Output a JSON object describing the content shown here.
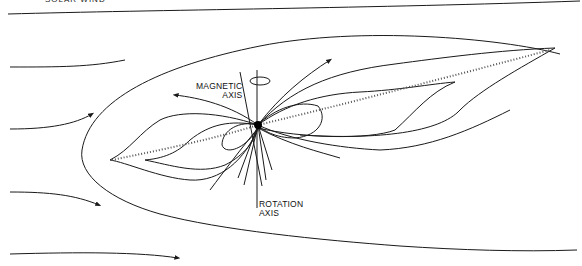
{
  "diagram": {
    "title_cropped": "SOLAR WIND",
    "labels": {
      "magnetic_axis_line1": "MAGNETIC",
      "magnetic_axis_line2": "AXIS",
      "rotation_axis_line1": "ROTATION",
      "rotation_axis_line2": "AXIS"
    },
    "elements": {
      "central_body": "pulsar / magnetized star",
      "incoming_flow_lines": 5,
      "field_lines": "dipole magnetic field lines with direction arrows",
      "current_sheet": "dotted equatorial plasma sheet",
      "bow_boundary": "outer magnetosphere boundary"
    },
    "colors": {
      "line": "#1a1a1a",
      "background": "#ffffff"
    }
  }
}
